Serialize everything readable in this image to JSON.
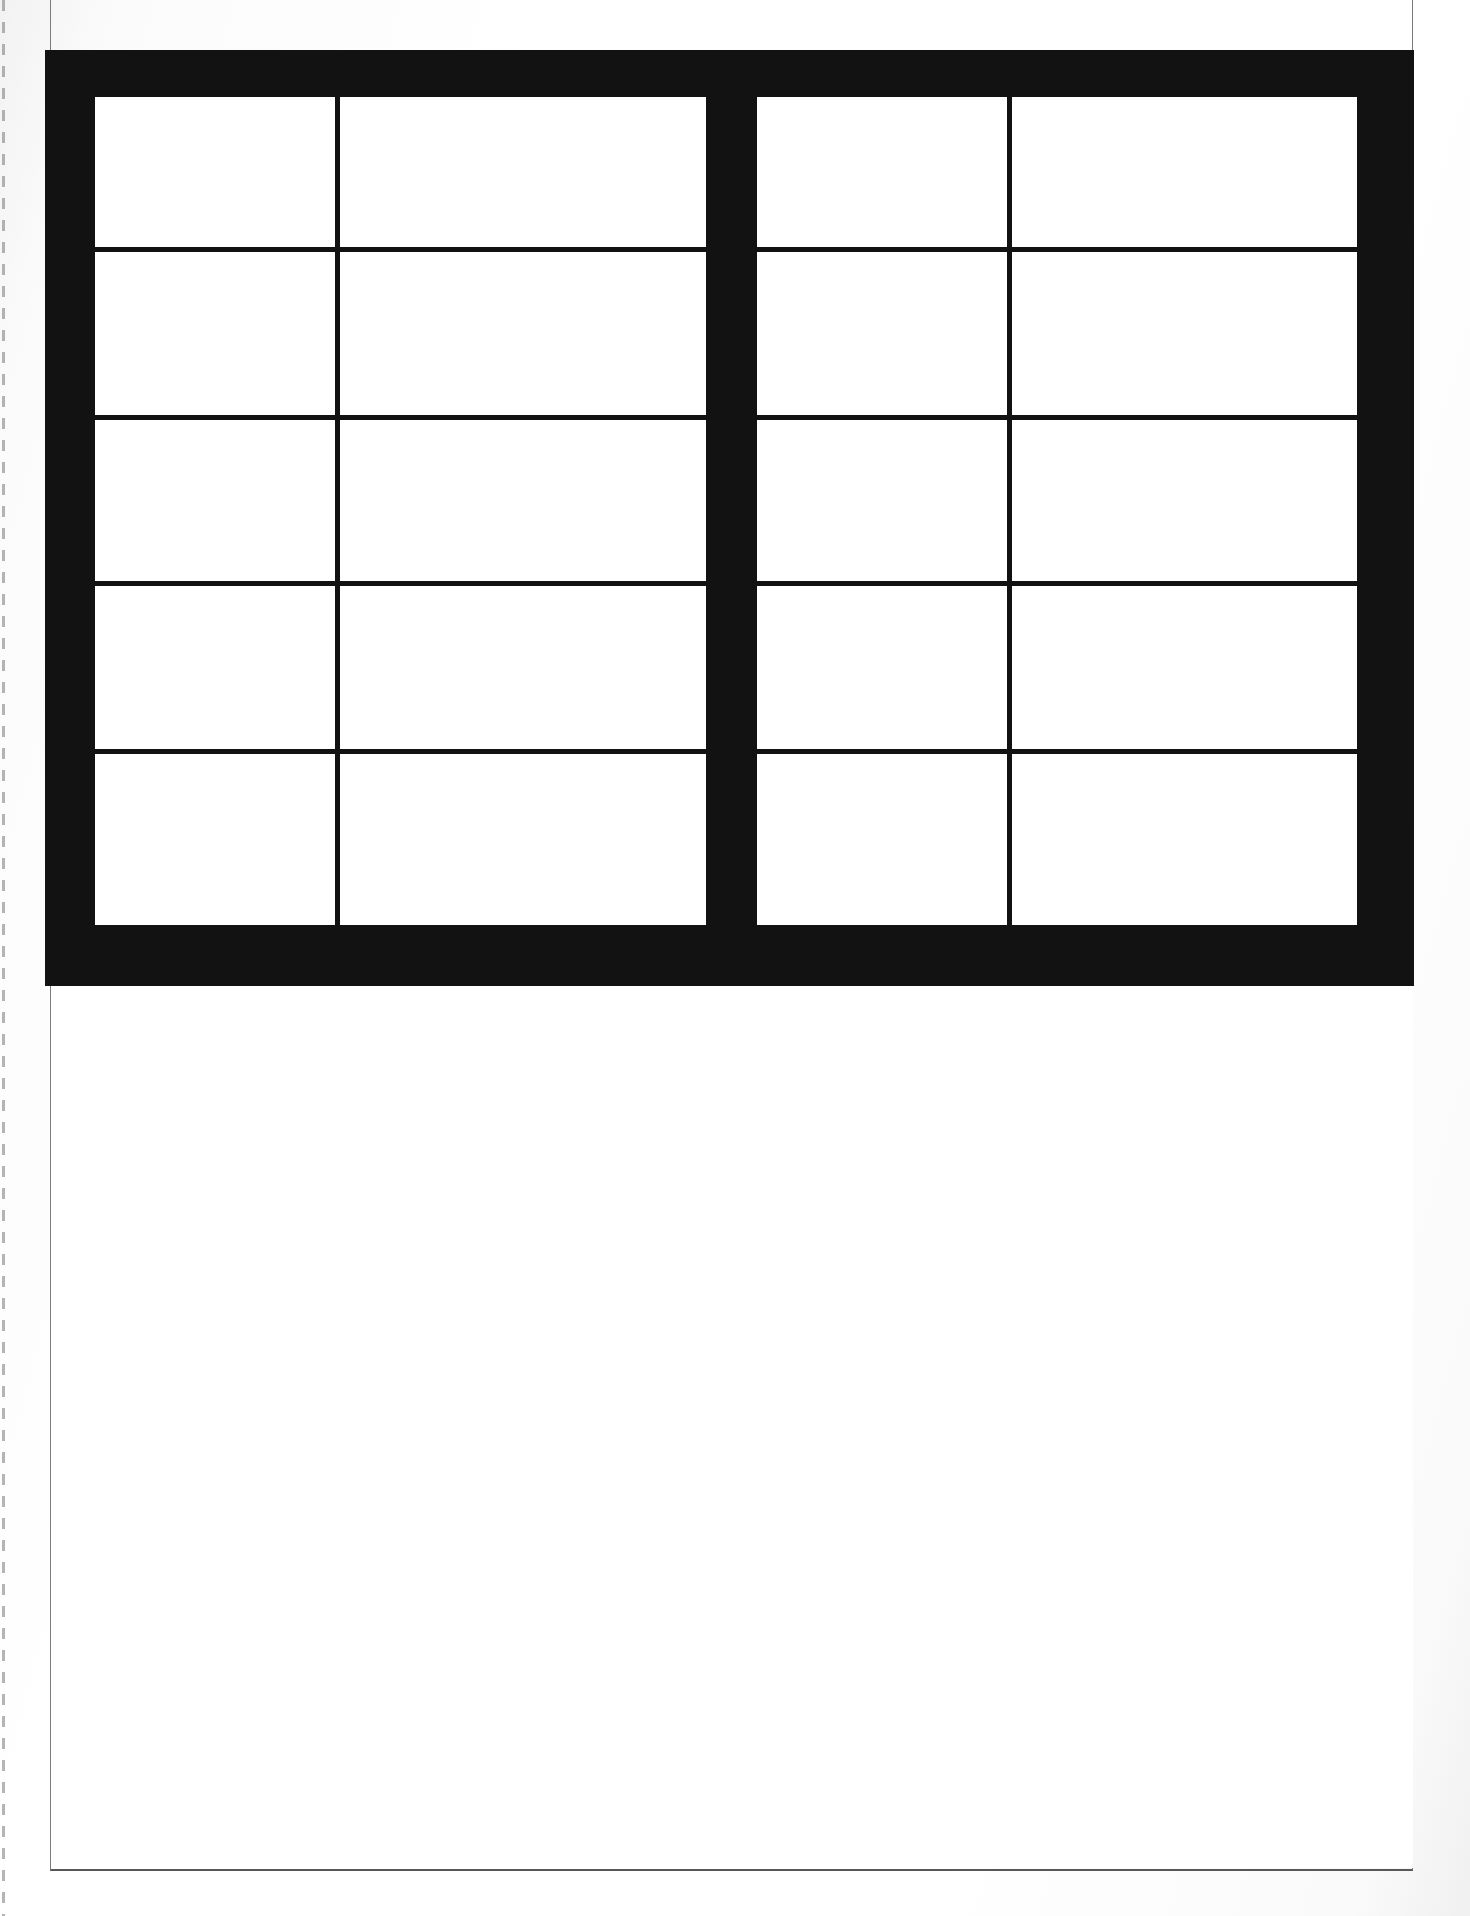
{
  "document": {
    "kind": "scanned-page",
    "page_background": "#ffffff",
    "ink_color": "#121212",
    "rule_color": "#7b7b7b",
    "caption": "",
    "visible_text": ""
  },
  "table": {
    "name": "empty-bordered-table",
    "border_color": "#121212",
    "cell_fill": "#ffffff",
    "row_count": 5,
    "column_count": 4,
    "split_into_halves": true,
    "half_divider": "thick-vertical-black-bar",
    "column_headers": [
      "",
      "",
      "",
      ""
    ],
    "rows": [
      {
        "cells": [
          "",
          "",
          "",
          ""
        ]
      },
      {
        "cells": [
          "",
          "",
          "",
          ""
        ]
      },
      {
        "cells": [
          "",
          "",
          "",
          ""
        ]
      },
      {
        "cells": [
          "",
          "",
          "",
          ""
        ]
      },
      {
        "cells": [
          "",
          "",
          "",
          ""
        ]
      }
    ]
  },
  "body": {
    "content": ""
  }
}
